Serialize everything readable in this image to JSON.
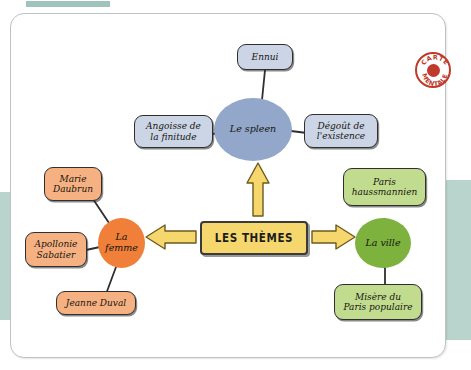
{
  "document": {
    "kind": "mind-map",
    "badge": {
      "line1": "CARTE",
      "line2": "MENTALE"
    }
  },
  "center": {
    "label": "LES THÈMES",
    "fill": "#f5d76e",
    "stroke": "#3a3a3a"
  },
  "branches": [
    {
      "id": "spleen",
      "hub": "Le spleen",
      "hub_fill": "#92a7c9",
      "leaf_fill": "#cbd5e6",
      "direction": "up",
      "leaves": [
        "Ennui",
        "Angoisse de\nla finitude",
        "Dégoût de\nl'existence"
      ]
    },
    {
      "id": "femme",
      "hub": "La\nfemme",
      "hub_fill": "#ef7f39",
      "leaf_fill": "#f6b183",
      "direction": "left",
      "leaves": [
        "Marie\nDaubrun",
        "Apollonie\nSabatier",
        "Jeanne Duval"
      ]
    },
    {
      "id": "ville",
      "hub": "La ville",
      "hub_fill": "#7db23e",
      "leaf_fill": "#c2dc8f",
      "direction": "right",
      "leaves": [
        "Paris\nhaussmannien",
        "Misère du\nParis populaire"
      ]
    }
  ],
  "nodes": {
    "ennui": "Ennui",
    "angoisse": "Angoisse de\nla finitude",
    "degout": "Dégoût de\nl'existence",
    "spleen": "Le spleen",
    "marie": "Marie\nDaubrun",
    "apollonie": "Apollonie\nSabatier",
    "jeanne": "Jeanne Duval",
    "femme": "La\nfemme",
    "paris_h": "Paris\nhaussmannien",
    "misere": "Misère du\nParis populaire",
    "ville": "La ville"
  },
  "colors": {
    "accent_yellow": "#f5d76e",
    "blue": "#92a7c9",
    "orange": "#ef7f39",
    "green": "#7db23e",
    "teal_block": "#b9d4cd",
    "stamp_red": "#c0392b",
    "ink": "#2f2f2f"
  }
}
